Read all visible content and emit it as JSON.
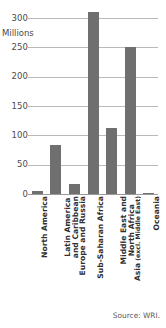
{
  "chart_data": {
    "type": "bar",
    "title": "",
    "subtitle": "",
    "xlabel": "",
    "ylabel": "Millions",
    "unit_label": "Millions",
    "ylim": [
      0,
      300
    ],
    "yticks": [
      0,
      50,
      100,
      150,
      200,
      250,
      300
    ],
    "ytick_labels": [
      "0",
      "50",
      "100",
      "150",
      "200",
      "250",
      "300"
    ],
    "grid": true,
    "legend": "none",
    "bar_color": "#6f6f6f",
    "categories": [
      "North America",
      "Latin America and Caribbean",
      "Europe and Russia",
      "Sub-Saharan Africa",
      "Middle East and North Africa",
      "Asia (excl. Middle East)",
      "Oceania"
    ],
    "category_lines": [
      [
        "North America"
      ],
      [
        "Latin America",
        "and Caribbean"
      ],
      [
        "Europe and Russia"
      ],
      [
        "Sub-Saharan Africa"
      ],
      [
        "Middle East and",
        "North Africa"
      ],
      [
        "Asia (excl. Middle East)"
      ],
      [
        "Oceania"
      ]
    ],
    "values": [
      5,
      83,
      17,
      310,
      113,
      250,
      2
    ]
  },
  "source": {
    "text": "Source: WRI."
  }
}
